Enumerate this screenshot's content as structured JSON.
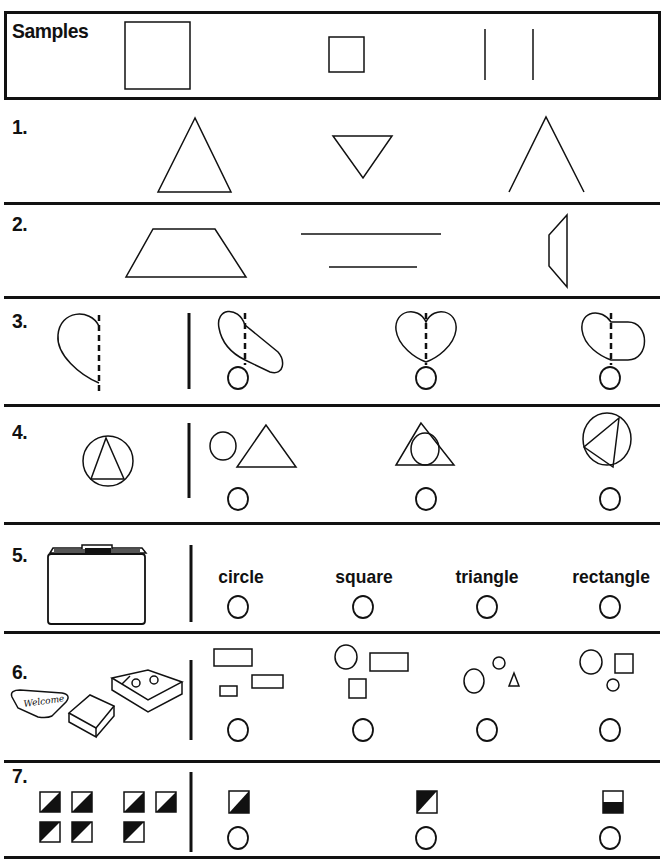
{
  "samples": {
    "label": "Samples",
    "items": [
      "large-rectangle",
      "small-square",
      "two-parallel-lines"
    ]
  },
  "questions": [
    {
      "number": "1.",
      "choices": [
        "triangle",
        "inverted-triangle",
        "open-angle"
      ]
    },
    {
      "number": "2.",
      "choices": [
        "trapezoid",
        "two-parallel-lines",
        "vertical-trapezoid"
      ]
    },
    {
      "number": "3.",
      "prompt": "half-heart-with-dashed-line",
      "choices": [
        "oval-completion",
        "heart-completion",
        "rounded-rectangle-completion"
      ],
      "answer_bubbles": 3
    },
    {
      "number": "4.",
      "prompt": "triangle-in-circle",
      "choices": [
        "circle-beside-triangle",
        "circle-in-triangle",
        "rotated-triangle-in-circle"
      ],
      "answer_bubbles": 3
    },
    {
      "number": "5.",
      "prompt": "folder-icon",
      "choices": [
        "circle",
        "square",
        "triangle",
        "rectangle"
      ],
      "answer_bubbles": 4
    },
    {
      "number": "6.",
      "prompt": "welcome-mat-book-box-pictures",
      "choices": [
        "rectangles-group",
        "circle-rectangles-square",
        "circles-triangle",
        "circles-square"
      ],
      "answer_bubbles": 4
    },
    {
      "number": "7.",
      "prompt": "half-shaded-squares-pattern",
      "choices": [
        "square-shaded-bottom-right",
        "square-shaded-top-left",
        "square-shaded-bottom-half"
      ],
      "answer_bubbles": 3
    }
  ],
  "colors": {
    "ink": "#111111",
    "paper": "#ffffff"
  }
}
